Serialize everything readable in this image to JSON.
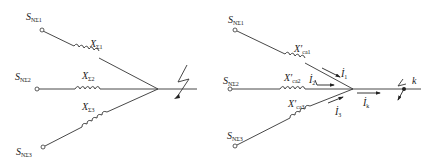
{
  "left_diagram": {
    "sources": [
      {
        "main": "S",
        "sub": "NΣ1"
      },
      {
        "main": "S",
        "sub": "NΣ2"
      },
      {
        "main": "S",
        "sub": "NΣ3"
      }
    ],
    "reactances": [
      {
        "main": "X",
        "sub": "Σ1"
      },
      {
        "main": "X",
        "sub": "Σ2"
      },
      {
        "main": "X",
        "sub": "Σ3"
      }
    ]
  },
  "right_diagram": {
    "sources": [
      {
        "main": "S",
        "sub": "NΣ1"
      },
      {
        "main": "S",
        "sub": "NΣ2"
      },
      {
        "main": "S",
        "sub": "NΣ3"
      }
    ],
    "reactances": [
      {
        "main": "X′",
        "sub": "ca1"
      },
      {
        "main": "X′",
        "sub": "ca2"
      },
      {
        "main": "X′",
        "sub": "ca3"
      }
    ],
    "currents": [
      {
        "main": "İ",
        "sub": "1"
      },
      {
        "main": "İ",
        "sub": "2"
      },
      {
        "main": "İ",
        "sub": "3"
      },
      {
        "main": "İ",
        "sub": "k"
      }
    ],
    "fault_label": "k"
  }
}
